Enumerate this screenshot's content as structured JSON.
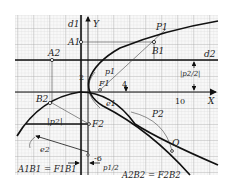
{
  "diagram": {
    "axes": {
      "x_label": "X",
      "y_label": "Y",
      "tick_labels": [
        "2",
        "4",
        "10",
        "-6"
      ]
    },
    "directrices": {
      "d1": "d1",
      "d2": "d2"
    },
    "parabolas": {
      "P1": "P1",
      "P2": "P2"
    },
    "points": {
      "A1": "A1",
      "A2": "A2",
      "B1": "B1",
      "B2": "B2",
      "F1": "F1",
      "F2": "F2",
      "Q": "Q"
    },
    "dimensions": {
      "p1": "p1",
      "p2": "|p2|",
      "half_p2": "|p2/2|",
      "half_p1": "p1/2",
      "e1": "e1",
      "e2": "e2"
    },
    "equations": {
      "eq1": "A1B1 = F1B1",
      "eq2": "A2B2 = F2B2"
    },
    "colors": {
      "ink": "#1a1a1a",
      "grid_minor": "#d0d0d0",
      "grid_major": "#a8a8a8",
      "paper": "#f7f7f7"
    }
  }
}
